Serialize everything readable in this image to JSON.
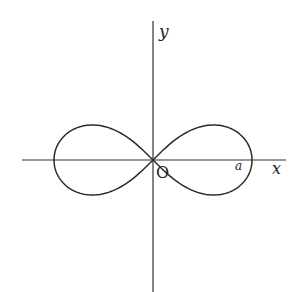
{
  "figure": {
    "curve": {
      "type": "lemniscate",
      "equation": "(x^2 + y^2)^2 = a^2 (x^2 - y^2)",
      "stroke_color": "#2b2b2b"
    },
    "axes": {
      "x_label": "x",
      "y_label": "y",
      "color": "#333333"
    },
    "labels": {
      "origin": "O",
      "intercept": "a"
    }
  }
}
